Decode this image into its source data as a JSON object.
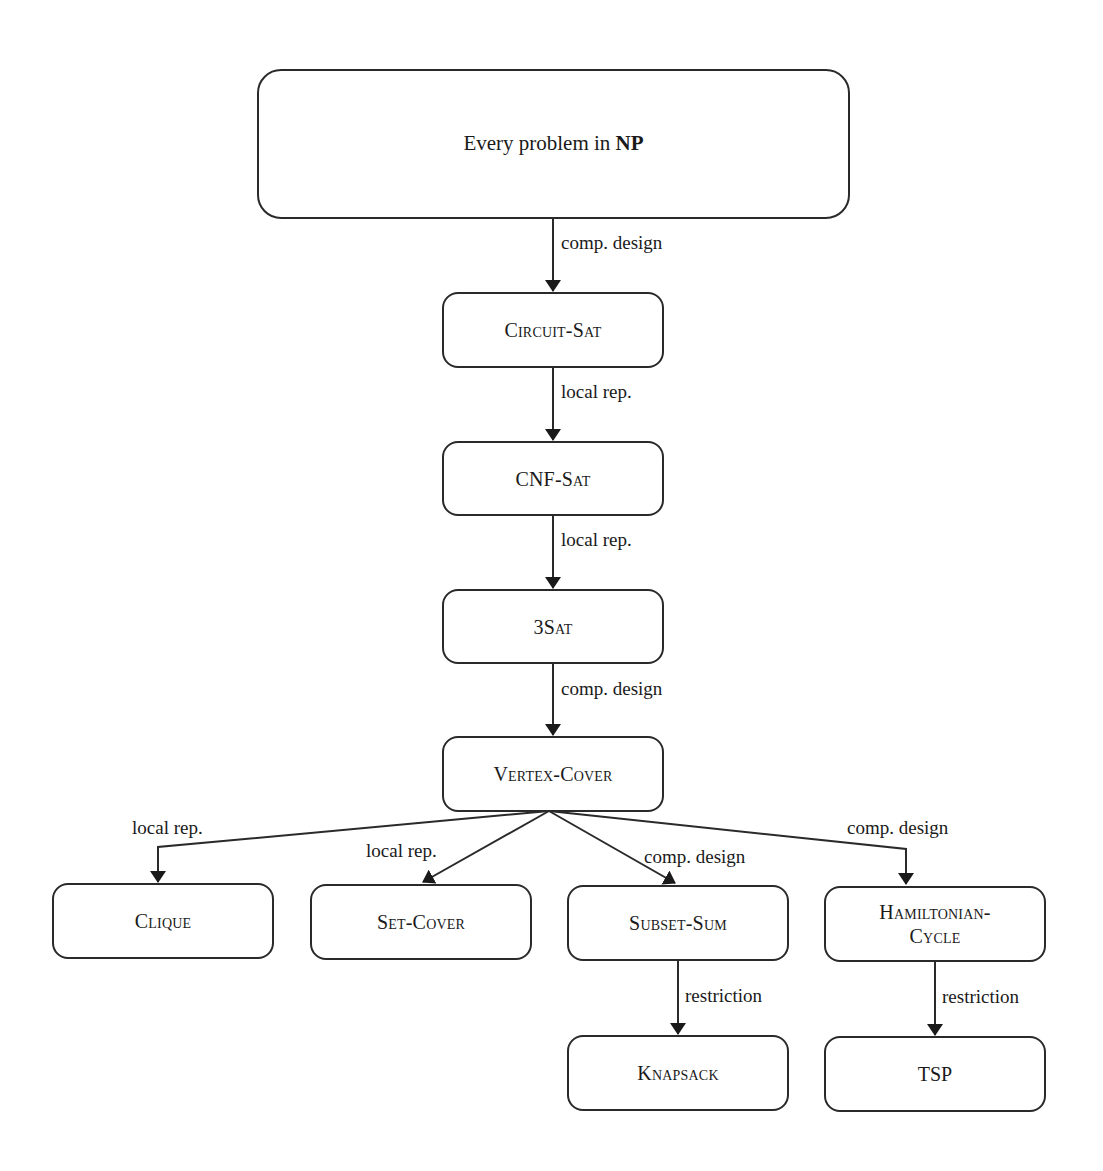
{
  "diagram": {
    "root": {
      "text": "Every problem in ",
      "emph": "NP"
    },
    "nodes": {
      "circuit_sat": "Circuit-Sat",
      "cnf_sat": "CNF-Sat",
      "three_sat": "3Sat",
      "vertex_cover": "Vertex-Cover",
      "clique": "Clique",
      "set_cover": "Set-Cover",
      "subset_sum": "Subset-Sum",
      "hamiltonian_1": "Hamiltonian-",
      "hamiltonian_2": "Cycle",
      "knapsack": "Knapsack",
      "tsp": "TSP"
    },
    "edges": {
      "np_to_circuit": "comp. design",
      "circuit_to_cnf": "local rep.",
      "cnf_to_3sat": "local rep.",
      "threesat_to_vc": "comp. design",
      "vc_to_clique": "local rep.",
      "vc_to_setcover": "local rep.",
      "vc_to_subsetsum": "comp. design",
      "vc_to_hamiltonian": "comp. design",
      "subsetsum_to_knapsack": "restriction",
      "hamiltonian_to_tsp": "restriction"
    },
    "colors": {
      "stroke": "#2a2a2a",
      "background": "#ffffff",
      "text": "#1a1a1a"
    }
  }
}
